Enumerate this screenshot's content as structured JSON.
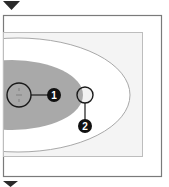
{
  "diagram": {
    "colors": {
      "background": "#ffffff",
      "frame": "#7a7a7a",
      "inner_rect_fill": "#f4f4f4",
      "inner_rect_stroke": "#bdbdbd",
      "outer_ellipse_stroke": "#a8a8a8",
      "inner_ellipse_fill": "#a9a9a9",
      "circle_stroke": "#1a1a1a",
      "marker_fill": "#111111",
      "marker_text": "#ffffff",
      "triangle": "#2a2a2a"
    },
    "markers": {
      "top_triangle": "down-triangle",
      "bottom_triangle": "down-triangle"
    },
    "callouts": [
      {
        "label": "1"
      },
      {
        "label": "2"
      }
    ]
  }
}
